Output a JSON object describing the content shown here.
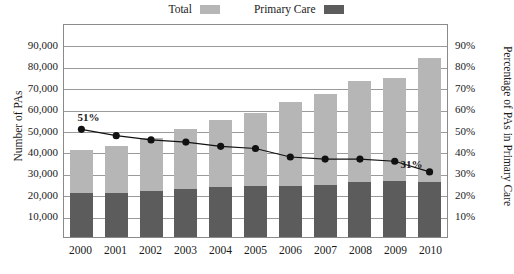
{
  "legend": {
    "entries": [
      {
        "label": "Total",
        "color": "#b6b6b6",
        "swatch_name": "total-swatch"
      },
      {
        "label": "Primary Care",
        "color": "#5c5c5c",
        "swatch_name": "primary-care-swatch"
      }
    ]
  },
  "axes": {
    "left_title": "Number of PAs",
    "right_title": "Percentage of PAs in Primary Care",
    "left_ticks": [
      "90,000",
      "80,000",
      "70,000",
      "60,000",
      "50,000",
      "40,000",
      "30,000",
      "20,000",
      "10,000"
    ],
    "right_ticks": [
      "90%",
      "80%",
      "70%",
      "60%",
      "50%",
      "40%",
      "30%",
      "20%",
      "10%"
    ]
  },
  "callouts": [
    {
      "label": "51%",
      "year": "2000"
    },
    {
      "label": "31%",
      "year": "2010"
    }
  ],
  "chart_data": {
    "type": "bar",
    "title": "",
    "xlabel": "",
    "ylabel": "Number of PAs",
    "y2label": "Percentage of PAs in Primary Care",
    "categories": [
      "2000",
      "2001",
      "2002",
      "2003",
      "2004",
      "2005",
      "2006",
      "2007",
      "2008",
      "2009",
      "2010"
    ],
    "ylim": [
      0,
      100000
    ],
    "y2lim": [
      0,
      100
    ],
    "grid": true,
    "legend_position": "top-center",
    "stacked": true,
    "series": [
      {
        "name": "Total",
        "type": "bar",
        "color": "#b6b6b6",
        "axis": "left",
        "values": [
          40500,
          42500,
          46500,
          50500,
          54500,
          58000,
          63000,
          67000,
          73000,
          74500,
          83500
        ]
      },
      {
        "name": "Primary Care",
        "type": "bar",
        "color": "#5c5c5c",
        "axis": "left",
        "values": [
          20500,
          20500,
          21500,
          22500,
          23500,
          24000,
          24000,
          24500,
          25500,
          26000,
          25500
        ]
      },
      {
        "name": "Percentage of PAs in Primary Care",
        "type": "line",
        "color": "#111111",
        "axis": "right",
        "values": [
          51,
          48,
          46,
          45,
          43,
          42,
          38,
          37,
          37,
          36,
          31
        ]
      }
    ]
  }
}
